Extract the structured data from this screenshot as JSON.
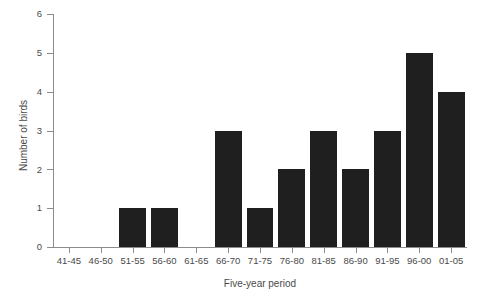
{
  "chart_data": {
    "type": "bar",
    "title": "",
    "xlabel": "Five-year period",
    "ylabel": "Number of birds",
    "categories": [
      "41-45",
      "46-50",
      "51-55",
      "56-60",
      "61-65",
      "66-70",
      "71-75",
      "76-80",
      "81-85",
      "86-90",
      "91-95",
      "96-00",
      "01-05"
    ],
    "values": [
      0,
      0,
      1,
      1,
      0,
      3,
      1,
      2,
      3,
      2,
      3,
      5,
      4
    ],
    "ylim": [
      0,
      6
    ],
    "yticks": [
      0,
      1,
      2,
      3,
      4,
      5,
      6
    ],
    "ytick_labels": [
      "0",
      "1",
      "2",
      "3",
      "4",
      "5",
      "6"
    ],
    "grid": false,
    "legend": null,
    "bar_color": "#1f1f1f",
    "axis_color": "#8c8c8c",
    "text_color": "#4a4a4a"
  }
}
